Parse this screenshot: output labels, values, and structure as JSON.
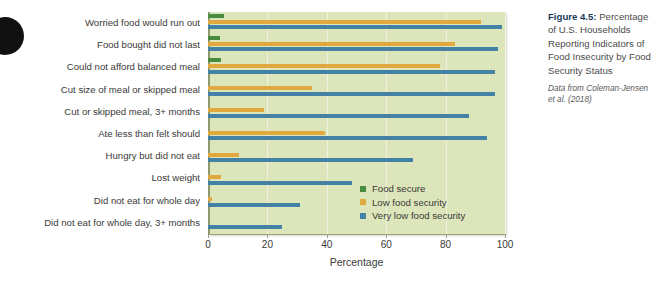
{
  "caption": {
    "figure_number": "Figure 4.5:",
    "text": " Percentage of U.S. Households Reporting Indicators of Food Insecurity by Food Security Status",
    "source": "Data from Coleman-Jensen et al. (2018)"
  },
  "chart_data": {
    "type": "bar",
    "orientation": "horizontal",
    "title": "",
    "xlabel": "Percentage",
    "ylabel": "",
    "xlim": [
      0,
      100
    ],
    "xticks": [
      0,
      20,
      40,
      60,
      80,
      100
    ],
    "grid": true,
    "legend_position": "inside-lower-right",
    "categories": [
      "Worried food would run out",
      "Food bought did not last",
      "Could not afford balanced meal",
      "Cut size of meal or skipped meal",
      "Cut or skipped meal, 3+ months",
      "Ate less than felt should",
      "Hungry but did not eat",
      "Lost weight",
      "Did not eat for whole day",
      "Did not eat for whole day, 3+ months"
    ],
    "series": [
      {
        "name": "Food secure",
        "color": "#4a8c3f",
        "values": [
          5.5,
          4,
          4.5,
          0,
          0,
          0,
          0,
          0,
          0,
          0
        ]
      },
      {
        "name": "Low food security",
        "color": "#e0a93f",
        "values": [
          92,
          83,
          78,
          35,
          19,
          39.5,
          10.5,
          4.5,
          1.5,
          0
        ]
      },
      {
        "name": "Very low food security",
        "color": "#4580a5",
        "values": [
          99,
          97.5,
          96.5,
          96.5,
          88,
          94,
          69,
          48.5,
          31,
          25
        ]
      }
    ]
  }
}
